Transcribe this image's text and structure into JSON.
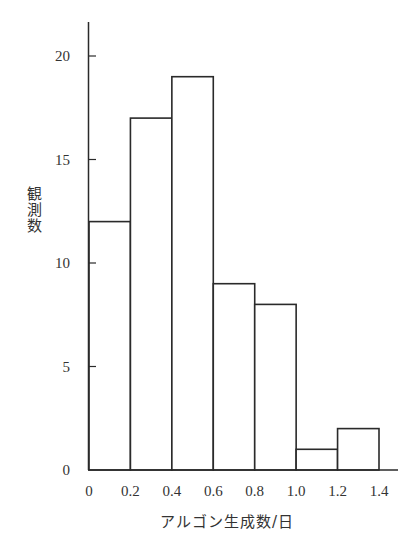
{
  "chart_data": {
    "type": "bar",
    "subtype": "histogram",
    "title": "",
    "xlabel": "アルゴン生成数/日",
    "ylabel": "観測数",
    "bin_edges": [
      0,
      0.2,
      0.4,
      0.6,
      0.8,
      1.0,
      1.2,
      1.4
    ],
    "categories": [
      "0-0.2",
      "0.2-0.4",
      "0.4-0.6",
      "0.6-0.8",
      "0.8-1.0",
      "1.0-1.2",
      "1.2-1.4"
    ],
    "values": [
      12,
      17,
      19,
      9,
      8,
      1,
      2
    ],
    "x_tick_labels": [
      "0",
      "0.2",
      "0.4",
      "0.6",
      "0.8",
      "1.0",
      "1.2",
      "1.4"
    ],
    "y_ticks": [
      0,
      5,
      10,
      15,
      20
    ],
    "y_tick_labels": [
      "0",
      "5",
      "10",
      "15",
      "20"
    ],
    "xlim": [
      0,
      1.48
    ],
    "ylim": [
      0,
      21.8
    ],
    "grid": false,
    "legend": null,
    "colors": {
      "bar_fill": "#ffffff",
      "bar_edge": "#2a2a2a",
      "axis": "#2a2a2a"
    }
  }
}
